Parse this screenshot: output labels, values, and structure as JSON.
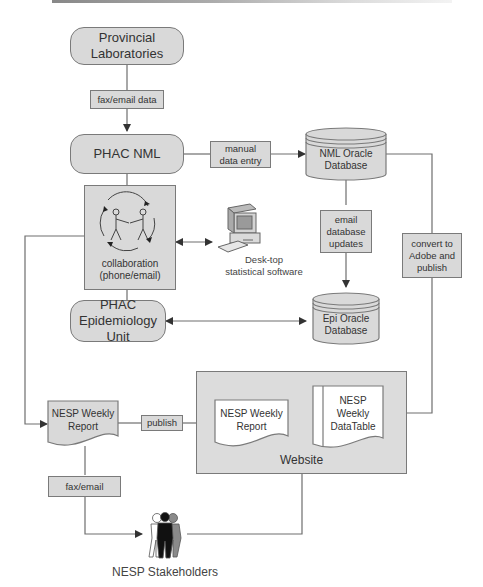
{
  "diagram": {
    "nodes": {
      "provincial_labs": "Provincial\nLaboratories",
      "phac_nml": "PHAC NML",
      "nml_db": "NML Oracle\nDatabase",
      "collaboration": "collaboration\n(phone/email)",
      "desktop": "Desk-top\nstatistical software",
      "epi_unit": "PHAC\nEpidemiology Unit",
      "epi_db": "Epi Oracle\nDatabase",
      "weekly_report": "NESP Weekly\nReport",
      "website": "Website",
      "web_report": "NESP Weekly\nReport",
      "web_datatable": "NESP\nWeekly\nDataTable",
      "stakeholders": "NESP Stakeholders"
    },
    "edge_labels": {
      "fax_email_data": "fax/email data",
      "manual_entry": "manual\ndata entry",
      "email_updates": "email\ndatabase\nupdates",
      "convert_publish": "convert to\nAdobe and\npublish",
      "publish": "publish",
      "fax_email": "fax/email"
    },
    "colors": {
      "box_fill": "#d9d9d9",
      "stroke": "#7a7a7a",
      "text": "#333333",
      "background": "#ffffff"
    }
  }
}
